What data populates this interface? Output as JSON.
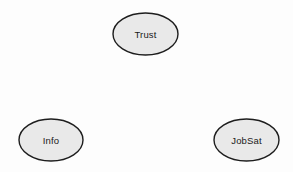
{
  "diagram": {
    "type": "path-diagram",
    "title": "",
    "canvas": {
      "width": 293,
      "height": 172,
      "background_color": "#fdfdfd"
    },
    "style": {
      "node_fill_color": "#e9e9e9",
      "node_stroke_color": "#1d1d1d",
      "node_stroke_width": 1.4,
      "label_color": "#1a1a1a",
      "label_font_size": 9.5
    },
    "nodes": [
      {
        "id": "trust",
        "label": "Trust",
        "shape": "ellipse",
        "cx": 145.5,
        "cy": 34,
        "rx": 32.5,
        "ry": 21
      },
      {
        "id": "info",
        "label": "Info",
        "shape": "ellipse",
        "cx": 51,
        "cy": 140,
        "rx": 32,
        "ry": 21
      },
      {
        "id": "jobsat",
        "label": "JobSat",
        "shape": "ellipse",
        "cx": 246.5,
        "cy": 140,
        "rx": 32.5,
        "ry": 21
      }
    ],
    "edges": []
  }
}
